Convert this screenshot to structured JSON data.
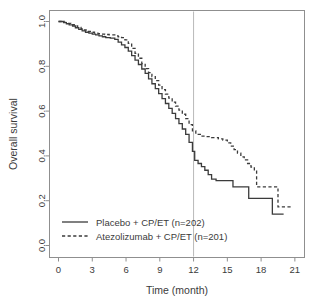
{
  "chart_data": {
    "type": "line",
    "title": "",
    "subtitle": "",
    "xlabel": "Time (month)",
    "ylabel": "Overall survival",
    "xlim": [
      0,
      21.5
    ],
    "ylim": [
      0.0,
      1.0
    ],
    "xticks": [
      0,
      3,
      6,
      9,
      12,
      15,
      18,
      21
    ],
    "xtick_labels": [
      "0",
      "3",
      "6",
      "9",
      "12",
      "15",
      "18",
      "21"
    ],
    "yticks": [
      0.0,
      0.2,
      0.4,
      0.6,
      0.8,
      1.0
    ],
    "ytick_labels": [
      "0.0",
      "0.2",
      "0.4",
      "0.6",
      "0.8",
      "1.0"
    ],
    "grid": false,
    "legend_position": "bottom-left",
    "annotations": [
      {
        "name": "reference-line-month-12",
        "type": "vline",
        "x": 12,
        "color": "#b9b9b9",
        "label": ""
      }
    ],
    "series": [
      {
        "name": "Placebo + CP/ET (n=202)",
        "group": "Placebo + CP/ET",
        "n": 202,
        "style": "solid",
        "color": "#3b3b3b",
        "points": [
          [
            0.0,
            1.0
          ],
          [
            0.45,
            0.995
          ],
          [
            0.7,
            0.99
          ],
          [
            0.95,
            0.985
          ],
          [
            1.25,
            0.98
          ],
          [
            1.5,
            0.972
          ],
          [
            1.8,
            0.965
          ],
          [
            2.1,
            0.958
          ],
          [
            2.4,
            0.952
          ],
          [
            2.7,
            0.948
          ],
          [
            3.0,
            0.944
          ],
          [
            3.3,
            0.94
          ],
          [
            3.6,
            0.936
          ],
          [
            3.9,
            0.932
          ],
          [
            4.2,
            0.928
          ],
          [
            4.6,
            0.926
          ],
          [
            5.0,
            0.92
          ],
          [
            5.3,
            0.908
          ],
          [
            5.6,
            0.896
          ],
          [
            5.9,
            0.884
          ],
          [
            6.2,
            0.868
          ],
          [
            6.5,
            0.848
          ],
          [
            6.8,
            0.828
          ],
          [
            7.1,
            0.808
          ],
          [
            7.4,
            0.788
          ],
          [
            7.7,
            0.768
          ],
          [
            8.0,
            0.744
          ],
          [
            8.3,
            0.722
          ],
          [
            8.6,
            0.7
          ],
          [
            8.9,
            0.678
          ],
          [
            9.2,
            0.656
          ],
          [
            9.5,
            0.634
          ],
          [
            9.8,
            0.612
          ],
          [
            10.1,
            0.59
          ],
          [
            10.4,
            0.566
          ],
          [
            10.7,
            0.544
          ],
          [
            11.0,
            0.52
          ],
          [
            11.3,
            0.496
          ],
          [
            11.6,
            0.46
          ],
          [
            11.9,
            0.42
          ],
          [
            12.1,
            0.38
          ],
          [
            12.4,
            0.366
          ],
          [
            12.7,
            0.352
          ],
          [
            13.0,
            0.336
          ],
          [
            13.3,
            0.316
          ],
          [
            13.6,
            0.296
          ],
          [
            14.0,
            0.29
          ],
          [
            15.0,
            0.29
          ],
          [
            15.4,
            0.29
          ],
          [
            15.5,
            0.262
          ],
          [
            16.0,
            0.262
          ],
          [
            16.8,
            0.262
          ],
          [
            16.9,
            0.21
          ],
          [
            17.5,
            0.21
          ],
          [
            18.0,
            0.21
          ],
          [
            18.6,
            0.21
          ],
          [
            18.9,
            0.21
          ],
          [
            19.0,
            0.14
          ],
          [
            19.5,
            0.14
          ],
          [
            20.0,
            0.14
          ]
        ]
      },
      {
        "name": "Atezolizumab + CP/ET (n=201)",
        "group": "Atezolizumab + CP/ET",
        "n": 201,
        "style": "dashed",
        "color": "#3b3b3b",
        "points": [
          [
            0.0,
            1.0
          ],
          [
            0.5,
            0.996
          ],
          [
            0.8,
            0.992
          ],
          [
            1.1,
            0.986
          ],
          [
            1.4,
            0.98
          ],
          [
            1.7,
            0.974
          ],
          [
            2.0,
            0.968
          ],
          [
            2.3,
            0.962
          ],
          [
            2.6,
            0.956
          ],
          [
            2.9,
            0.952
          ],
          [
            3.2,
            0.948
          ],
          [
            3.5,
            0.946
          ],
          [
            3.8,
            0.944
          ],
          [
            4.1,
            0.942
          ],
          [
            4.5,
            0.94
          ],
          [
            5.0,
            0.936
          ],
          [
            5.3,
            0.932
          ],
          [
            5.6,
            0.928
          ],
          [
            5.9,
            0.918
          ],
          [
            6.2,
            0.902
          ],
          [
            6.5,
            0.88
          ],
          [
            6.8,
            0.858
          ],
          [
            7.1,
            0.836
          ],
          [
            7.4,
            0.812
          ],
          [
            7.7,
            0.79
          ],
          [
            8.0,
            0.772
          ],
          [
            8.3,
            0.754
          ],
          [
            8.6,
            0.736
          ],
          [
            8.9,
            0.716
          ],
          [
            9.2,
            0.696
          ],
          [
            9.5,
            0.676
          ],
          [
            9.8,
            0.658
          ],
          [
            10.1,
            0.64
          ],
          [
            10.4,
            0.622
          ],
          [
            10.7,
            0.604
          ],
          [
            11.0,
            0.586
          ],
          [
            11.3,
            0.566
          ],
          [
            11.6,
            0.54
          ],
          [
            11.9,
            0.512
          ],
          [
            12.2,
            0.496
          ],
          [
            12.6,
            0.488
          ],
          [
            13.0,
            0.486
          ],
          [
            13.6,
            0.482
          ],
          [
            14.2,
            0.476
          ],
          [
            14.6,
            0.47
          ],
          [
            15.0,
            0.458
          ],
          [
            15.3,
            0.444
          ],
          [
            15.6,
            0.428
          ],
          [
            15.9,
            0.412
          ],
          [
            16.2,
            0.396
          ],
          [
            16.5,
            0.382
          ],
          [
            16.8,
            0.366
          ],
          [
            17.1,
            0.35
          ],
          [
            17.4,
            0.338
          ],
          [
            17.6,
            0.262
          ],
          [
            18.2,
            0.262
          ],
          [
            18.8,
            0.262
          ],
          [
            19.3,
            0.262
          ],
          [
            19.5,
            0.172
          ],
          [
            20.2,
            0.172
          ],
          [
            20.8,
            0.172
          ]
        ]
      }
    ],
    "legend": [
      {
        "label": "Placebo + CP/ET (n=202)",
        "style": "solid"
      },
      {
        "label": "Atezolizumab + CP/ET (n=201)",
        "style": "dashed"
      }
    ]
  },
  "axes": {
    "y_title": "Overall survival",
    "x_title": "Time (month)"
  },
  "colors": {
    "line": "#3b3b3b",
    "frame": "#8f8f8f",
    "reference": "#b9b9b9",
    "background": "#ffffff"
  }
}
